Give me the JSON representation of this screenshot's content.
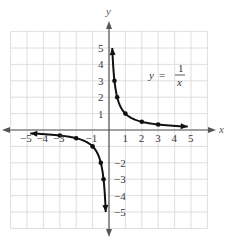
{
  "chart_data": {
    "type": "line",
    "title": "",
    "xlabel": "x",
    "ylabel": "y",
    "equation": {
      "lhs": "y",
      "eq": "=",
      "numerator": "1",
      "denominator": "x"
    },
    "xlim": [
      -6,
      6
    ],
    "ylim": [
      -6,
      6
    ],
    "grid": true,
    "x_ticks": [
      "-5",
      "-4",
      "-3",
      "-1",
      "1",
      "2",
      "3",
      "4",
      "5"
    ],
    "y_ticks": [
      "5",
      "4",
      "3",
      "2",
      "1",
      "-2",
      "-3",
      "-4",
      "-5"
    ],
    "series": [
      {
        "name": "y = 1/x (x > 0)",
        "points": [
          [
            0.3333,
            3
          ],
          [
            0.5,
            2
          ],
          [
            1,
            1
          ],
          [
            2,
            0.5
          ],
          [
            3,
            0.3333
          ]
        ],
        "arrows": [
          [
            0.2,
            4.8
          ],
          [
            4.8,
            0.2
          ]
        ]
      },
      {
        "name": "y = 1/x (x < 0)",
        "points": [
          [
            -0.3333,
            -3
          ],
          [
            -0.5,
            -2
          ],
          [
            -1,
            -1
          ],
          [
            -2,
            -0.5
          ],
          [
            -3,
            -0.3333
          ]
        ],
        "arrows": [
          [
            -0.2,
            -4.8
          ],
          [
            -4.8,
            -0.2
          ]
        ]
      }
    ],
    "colors": {
      "grid": "#d6d6d6",
      "axis": "#555555",
      "curve": "#111111"
    }
  }
}
